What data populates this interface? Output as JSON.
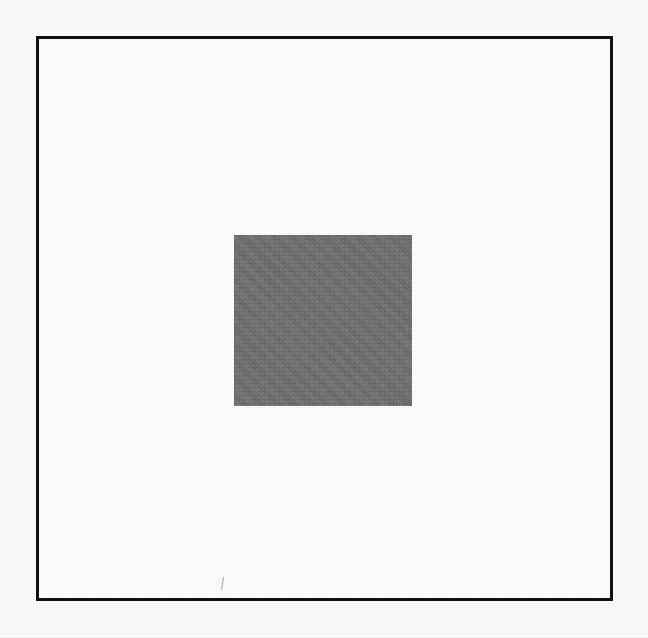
{
  "figure": {
    "title": "",
    "canvas": {
      "width": 648,
      "height": 638,
      "background_color": "#fdfdfd"
    },
    "outer_frame": {
      "shape": "square-outline",
      "x": 36,
      "y": 36,
      "width": 577,
      "height": 565,
      "stroke_color": "#121212",
      "stroke_width": 3,
      "fill_color": "#ffffff"
    },
    "inner_square": {
      "shape": "square-filled",
      "x": 234,
      "y": 235,
      "width": 178,
      "height": 171,
      "fill_color": "#707070",
      "stroke_color": "none"
    },
    "artifacts": [
      {
        "name": "scan-tick-mark",
        "x": 219,
        "y": 577,
        "width": 6,
        "height": 13,
        "color": "#3c3c3c"
      }
    ]
  },
  "chart_data": {
    "type": "diagram",
    "title": "",
    "xlabel": "",
    "ylabel": "",
    "description": "A large square outline drawn in black ink on a white page, with a smaller solid mid-gray square centered inside it.",
    "shapes": [
      {
        "id": "outer-frame",
        "type": "rect",
        "filled": false,
        "x": 36,
        "y": 36,
        "width": 577,
        "height": 565,
        "stroke": "#121212",
        "stroke_width": 3,
        "fill": "#ffffff"
      },
      {
        "id": "inner-square",
        "type": "rect",
        "filled": true,
        "x": 234,
        "y": 235,
        "width": 178,
        "height": 171,
        "stroke": "none",
        "stroke_width": 0,
        "fill": "#707070"
      }
    ],
    "legend": [],
    "annotations": []
  }
}
